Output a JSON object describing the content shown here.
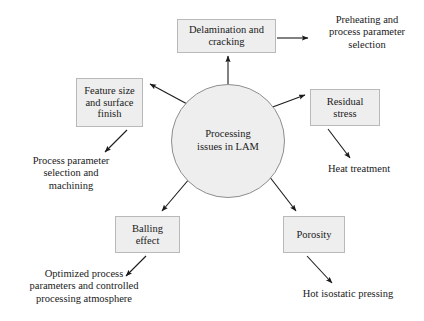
{
  "diagram": {
    "title": "Processing issues in LAM",
    "center": {
      "label": "Processing\nissues in LAM",
      "shape": "circle",
      "fill": "#eeeeee",
      "stroke": "#8e8e8e"
    },
    "issues": [
      {
        "id": "delamination",
        "label": "Delamination and\ncracking",
        "position": "top"
      },
      {
        "id": "feature-size",
        "label": "Feature size\nand surface\nfinish",
        "position": "upper-left"
      },
      {
        "id": "residual-stress",
        "label": "Residual\nstress",
        "position": "upper-right"
      },
      {
        "id": "balling-effect",
        "label": "Balling\neffect",
        "position": "lower-left"
      },
      {
        "id": "porosity",
        "label": "Porosity",
        "position": "lower-right"
      }
    ],
    "remedies": [
      {
        "id": "preheating",
        "label": "Preheating and\nprocess parameter\nselection",
        "from": "delamination"
      },
      {
        "id": "machining",
        "label": "Process parameter\nselection and\nmachining",
        "from": "feature-size"
      },
      {
        "id": "heat-treatment",
        "label": "Heat treatment",
        "from": "residual-stress"
      },
      {
        "id": "optimized-atmosphere",
        "label": "Optimized process\nparameters and controlled\nprocessing atmosphere",
        "from": "balling-effect"
      },
      {
        "id": "hot-isostatic-pressing",
        "label": "Hot isostatic pressing",
        "from": "porosity"
      }
    ],
    "style": {
      "box_fill": "#eeeeee",
      "box_stroke": "#b9b9b9",
      "arrow_color": "#1a1a1a",
      "background": "#ffffff"
    }
  }
}
